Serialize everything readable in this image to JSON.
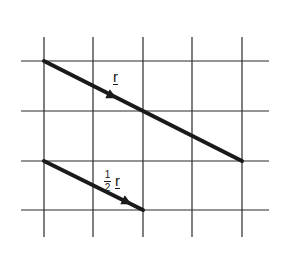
{
  "diagram": {
    "grid": {
      "vertical_x": [
        44,
        93,
        143,
        192,
        242
      ],
      "horizontal_y": [
        61,
        111,
        161,
        210
      ],
      "x_range": [
        21,
        269
      ],
      "y_range": [
        37,
        237
      ],
      "color": "#2a2a2a"
    },
    "vectors": [
      {
        "name": "r",
        "from": [
          44,
          61
        ],
        "to": [
          242,
          161
        ],
        "arrow_at": [
          112,
          96
        ]
      },
      {
        "name": "half-r",
        "from": [
          44,
          161
        ],
        "to": [
          143,
          210
        ],
        "arrow_at": [
          127,
          202
        ]
      }
    ],
    "labels": {
      "r": "r",
      "half_num": "1",
      "half_den": "2",
      "half_vec": "r"
    }
  }
}
